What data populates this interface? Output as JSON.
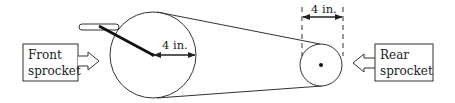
{
  "diagram": {
    "front_label_line1": "Front",
    "front_label_line2": "sprocket",
    "rear_label_line1": "Rear",
    "rear_label_line2": "sprocket",
    "front_radius_label": "4 in.",
    "rear_diameter_label": "4 in.",
    "colors": {
      "stroke": "#333333",
      "background": "#ffffff"
    }
  }
}
